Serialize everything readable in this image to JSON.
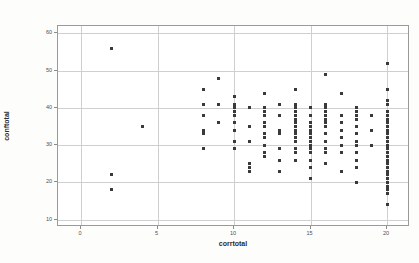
{
  "chart_data": {
    "type": "scatter",
    "title": "",
    "xlabel": "corrtotal",
    "ylabel": "conftotal",
    "xlim": [
      -1.5,
      21.5
    ],
    "ylim": [
      8,
      62
    ],
    "xticks": [
      0,
      5,
      10,
      15,
      20
    ],
    "yticks": [
      10,
      20,
      30,
      40,
      50,
      60
    ],
    "grid": true,
    "legend": "none",
    "marker_color": "#3a3a3a",
    "grid_color": "#cfcfcf",
    "frame_color": "#9a9a9a",
    "points": [
      [
        2,
        56
      ],
      [
        2,
        22
      ],
      [
        2,
        18
      ],
      [
        4,
        35
      ],
      [
        8,
        45
      ],
      [
        8,
        41
      ],
      [
        8,
        38
      ],
      [
        8,
        34
      ],
      [
        8,
        33
      ],
      [
        8,
        29
      ],
      [
        9,
        48
      ],
      [
        9,
        41
      ],
      [
        9,
        36
      ],
      [
        10,
        43
      ],
      [
        10,
        41
      ],
      [
        10,
        40
      ],
      [
        10,
        39
      ],
      [
        10,
        38
      ],
      [
        10,
        36
      ],
      [
        10,
        34
      ],
      [
        10,
        31
      ],
      [
        10,
        29
      ],
      [
        11,
        40
      ],
      [
        11,
        35
      ],
      [
        11,
        31
      ],
      [
        11,
        25
      ],
      [
        11,
        24
      ],
      [
        11,
        23
      ],
      [
        12,
        44
      ],
      [
        12,
        40
      ],
      [
        12,
        39
      ],
      [
        12,
        38
      ],
      [
        12,
        36
      ],
      [
        12,
        35
      ],
      [
        12,
        33
      ],
      [
        12,
        32
      ],
      [
        12,
        30
      ],
      [
        12,
        28
      ],
      [
        12,
        27
      ],
      [
        13,
        41
      ],
      [
        13,
        38
      ],
      [
        13,
        34
      ],
      [
        13,
        33
      ],
      [
        13,
        29
      ],
      [
        13,
        26
      ],
      [
        13,
        23
      ],
      [
        14,
        45
      ],
      [
        14,
        41
      ],
      [
        14,
        40
      ],
      [
        14,
        39
      ],
      [
        14,
        38
      ],
      [
        14,
        37
      ],
      [
        14,
        36
      ],
      [
        14,
        35
      ],
      [
        14,
        34
      ],
      [
        14,
        33
      ],
      [
        14,
        32
      ],
      [
        14,
        31
      ],
      [
        14,
        29
      ],
      [
        14,
        28
      ],
      [
        14,
        26
      ],
      [
        15,
        40
      ],
      [
        15,
        38
      ],
      [
        15,
        36
      ],
      [
        15,
        35
      ],
      [
        15,
        34
      ],
      [
        15,
        33
      ],
      [
        15,
        32
      ],
      [
        15,
        31
      ],
      [
        15,
        30
      ],
      [
        15,
        29
      ],
      [
        15,
        28
      ],
      [
        15,
        26
      ],
      [
        15,
        24
      ],
      [
        15,
        21
      ],
      [
        16,
        49
      ],
      [
        16,
        41
      ],
      [
        16,
        40
      ],
      [
        16,
        39
      ],
      [
        16,
        38
      ],
      [
        16,
        37
      ],
      [
        16,
        36
      ],
      [
        16,
        35
      ],
      [
        16,
        33
      ],
      [
        16,
        31
      ],
      [
        16,
        29
      ],
      [
        16,
        28
      ],
      [
        16,
        25
      ],
      [
        17,
        44
      ],
      [
        17,
        38
      ],
      [
        17,
        36
      ],
      [
        17,
        34
      ],
      [
        17,
        32
      ],
      [
        17,
        30
      ],
      [
        17,
        28
      ],
      [
        17,
        23
      ],
      [
        18,
        40
      ],
      [
        18,
        39
      ],
      [
        18,
        38
      ],
      [
        18,
        37
      ],
      [
        18,
        35
      ],
      [
        18,
        33
      ],
      [
        18,
        31
      ],
      [
        18,
        30
      ],
      [
        18,
        28
      ],
      [
        18,
        26
      ],
      [
        18,
        24
      ],
      [
        18,
        20
      ],
      [
        19,
        38
      ],
      [
        19,
        34
      ],
      [
        19,
        30
      ],
      [
        20,
        52
      ],
      [
        20,
        45
      ],
      [
        20,
        42
      ],
      [
        20,
        41
      ],
      [
        20,
        39
      ],
      [
        20,
        38
      ],
      [
        20,
        37
      ],
      [
        20,
        36
      ],
      [
        20,
        35
      ],
      [
        20,
        34
      ],
      [
        20,
        33
      ],
      [
        20,
        32
      ],
      [
        20,
        31
      ],
      [
        20,
        30
      ],
      [
        20,
        29
      ],
      [
        20,
        28
      ],
      [
        20,
        27
      ],
      [
        20,
        26
      ],
      [
        20,
        25
      ],
      [
        20,
        24
      ],
      [
        20,
        23
      ],
      [
        20,
        22
      ],
      [
        20,
        21
      ],
      [
        20,
        20
      ],
      [
        20,
        19
      ],
      [
        20,
        18
      ],
      [
        20,
        17
      ],
      [
        20,
        14
      ]
    ]
  }
}
